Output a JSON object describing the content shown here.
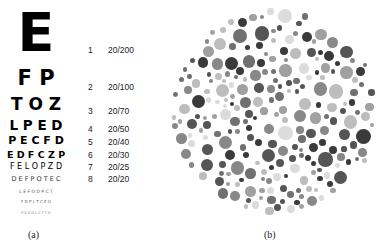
{
  "panel_a": {
    "caption": "(a)",
    "chart_rows": [
      {
        "letters": "E",
        "line": "1",
        "acuity": "20/200"
      },
      {
        "letters": "F P",
        "line": "2",
        "acuity": "20/100"
      },
      {
        "letters": "T O Z",
        "line": "3",
        "acuity": "20/70"
      },
      {
        "letters": "L P E D",
        "line": "4",
        "acuity": "20/50"
      },
      {
        "letters": "P E C F D",
        "line": "5",
        "acuity": "20/40"
      },
      {
        "letters": "E D F C Z P",
        "line": "6",
        "acuity": "20/30"
      },
      {
        "letters": "F E L O P Z D",
        "line": "7",
        "acuity": "20/25"
      },
      {
        "letters": "D E F P O T E C",
        "line": "8",
        "acuity": "20/20"
      },
      {
        "letters": "L E F O D P C T"
      },
      {
        "letters": "F D P L T C E O"
      },
      {
        "letters": "P E Z O L C F T D"
      }
    ]
  },
  "panel_b": {
    "caption": "(b)",
    "plate": {
      "cx": 275,
      "cy": 112,
      "r": 104
    },
    "palette": [
      "#3a3a3a",
      "#555555",
      "#707070",
      "#888888",
      "#a0a0a0",
      "#bdbdbd",
      "#dcdcdc"
    ]
  }
}
